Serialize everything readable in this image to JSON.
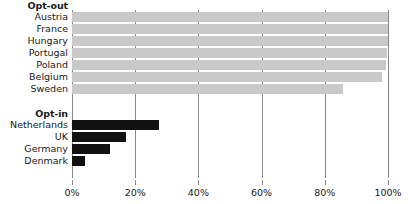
{
  "chart_data": {
    "type": "bar",
    "orientation": "horizontal",
    "title": "",
    "xlabel": "",
    "ylabel": "",
    "xlim": [
      0,
      100
    ],
    "grid": true,
    "legend": "none",
    "x_ticks": [
      "0%",
      "20%",
      "40%",
      "60%",
      "80%",
      "100%"
    ],
    "x_tick_values": [
      0,
      20,
      40,
      60,
      80,
      100
    ],
    "groups": [
      {
        "name": "Opt-out",
        "color": "#c9c9c9",
        "categories": [
          "Austria",
          "France",
          "Hungary",
          "Portugal",
          "Poland",
          "Belgium",
          "Sweden"
        ],
        "values": [
          99.98,
          99.91,
          99.9,
          99.6,
          99.5,
          98.0,
          85.9
        ]
      },
      {
        "name": "Opt-in",
        "color": "#111111",
        "categories": [
          "Netherlands",
          "UK",
          "Germany",
          "Denmark"
        ],
        "values": [
          27.5,
          17.2,
          12.0,
          4.2
        ]
      }
    ]
  },
  "axis": {
    "ticks": [
      {
        "label": "0%",
        "value": 0
      },
      {
        "label": "20%",
        "value": 20
      },
      {
        "label": "40%",
        "value": 40
      },
      {
        "label": "60%",
        "value": 60
      },
      {
        "label": "80%",
        "value": 80
      },
      {
        "label": "100%",
        "value": 100
      }
    ]
  },
  "rows": [
    {
      "label": "Opt-out",
      "type": "header",
      "group": "optout"
    },
    {
      "label": "Austria",
      "type": "bar",
      "group": "optout",
      "value": 99.98
    },
    {
      "label": "France",
      "type": "bar",
      "group": "optout",
      "value": 99.91
    },
    {
      "label": "Hungary",
      "type": "bar",
      "group": "optout",
      "value": 99.9
    },
    {
      "label": "Portugal",
      "type": "bar",
      "group": "optout",
      "value": 99.6
    },
    {
      "label": "Poland",
      "type": "bar",
      "group": "optout",
      "value": 99.5
    },
    {
      "label": "Belgium",
      "type": "bar",
      "group": "optout",
      "value": 98.0
    },
    {
      "label": "Sweden",
      "type": "bar",
      "group": "optout",
      "value": 85.9
    },
    {
      "label": "",
      "type": "spacer",
      "group": "none",
      "value": 0
    },
    {
      "label": "Opt-in",
      "type": "header",
      "group": "optin"
    },
    {
      "label": "Netherlands",
      "type": "bar",
      "group": "optin",
      "value": 27.5
    },
    {
      "label": "UK",
      "type": "bar",
      "group": "optin",
      "value": 17.2
    },
    {
      "label": "Germany",
      "type": "bar",
      "group": "optin",
      "value": 12.0
    },
    {
      "label": "Denmark",
      "type": "bar",
      "group": "optin",
      "value": 4.2
    }
  ],
  "colors": {
    "optout_bar": "#c9c9c9",
    "optin_bar": "#111111",
    "gridline": "#8a8a8a",
    "text": "#1a1a1a",
    "background": "#ffffff"
  }
}
